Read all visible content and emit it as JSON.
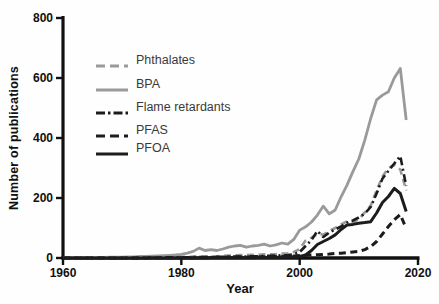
{
  "figure": {
    "background": "#fefefe",
    "axis_color": "#111111",
    "gray_series_color": "#9a9a9a",
    "black_series_color": "#1c1c1c"
  },
  "chart_data": {
    "type": "line",
    "title": "",
    "xlabel": "Year",
    "ylabel": "Number of publications",
    "xlim": [
      1960,
      2020
    ],
    "ylim": [
      0,
      800
    ],
    "xticks": [
      1960,
      1980,
      2000,
      2020
    ],
    "yticks": [
      0,
      200,
      400,
      600,
      800
    ],
    "grid": false,
    "legend_position": "upper-left-inside",
    "x": [
      1960,
      1961,
      1962,
      1963,
      1964,
      1965,
      1966,
      1967,
      1968,
      1969,
      1970,
      1971,
      1972,
      1973,
      1974,
      1975,
      1976,
      1977,
      1978,
      1979,
      1980,
      1981,
      1982,
      1983,
      1984,
      1985,
      1986,
      1987,
      1988,
      1989,
      1990,
      1991,
      1992,
      1993,
      1994,
      1995,
      1996,
      1997,
      1998,
      1999,
      2000,
      2001,
      2002,
      2003,
      2004,
      2005,
      2006,
      2007,
      2008,
      2009,
      2010,
      2011,
      2012,
      2013,
      2014,
      2015,
      2016,
      2017,
      2018
    ],
    "series": [
      {
        "name": "Phthalates",
        "color": "#9a9a9a",
        "line_style": "dashed",
        "line_width": 2.6,
        "values": [
          0,
          0,
          0,
          0,
          0,
          0,
          0,
          0,
          1,
          1,
          1,
          1,
          2,
          2,
          2,
          2,
          3,
          3,
          3,
          3,
          4,
          4,
          5,
          5,
          5,
          6,
          6,
          7,
          8,
          9,
          10,
          10,
          11,
          11,
          12,
          12,
          13,
          15,
          16,
          20,
          30,
          58,
          68,
          80,
          78,
          90,
          100,
          112,
          122,
          118,
          130,
          152,
          175,
          225,
          272,
          300,
          310,
          295,
          225
        ]
      },
      {
        "name": "BPA",
        "color": "#9a9a9a",
        "line_style": "solid",
        "line_width": 2.8,
        "values": [
          1,
          1,
          1,
          2,
          1,
          2,
          2,
          2,
          3,
          3,
          3,
          4,
          4,
          5,
          5,
          6,
          7,
          8,
          9,
          10,
          12,
          16,
          22,
          33,
          25,
          28,
          25,
          30,
          36,
          40,
          42,
          36,
          40,
          42,
          46,
          40,
          44,
          50,
          46,
          62,
          93,
          104,
          120,
          143,
          173,
          147,
          160,
          204,
          243,
          288,
          330,
          393,
          465,
          527,
          543,
          554,
          600,
          632,
          460
        ]
      },
      {
        "name": "Flame retardants",
        "color": "#1c1c1c",
        "line_style": "dash-dot",
        "line_width": 2.6,
        "values": [
          0,
          0,
          0,
          0,
          0,
          0,
          0,
          0,
          0,
          0,
          0,
          0,
          0,
          1,
          1,
          1,
          1,
          1,
          2,
          2,
          2,
          2,
          3,
          3,
          3,
          3,
          4,
          4,
          4,
          5,
          5,
          5,
          6,
          6,
          7,
          7,
          8,
          9,
          10,
          12,
          20,
          40,
          60,
          90,
          70,
          85,
          95,
          105,
          118,
          125,
          135,
          148,
          170,
          215,
          265,
          290,
          315,
          340,
          240
        ]
      },
      {
        "name": "PFAS",
        "color": "#1c1c1c",
        "line_style": "dashed",
        "line_width": 3,
        "values": [
          0,
          0,
          0,
          0,
          0,
          0,
          0,
          0,
          0,
          0,
          0,
          0,
          0,
          0,
          0,
          1,
          1,
          1,
          1,
          1,
          1,
          1,
          1,
          2,
          2,
          2,
          2,
          2,
          3,
          3,
          3,
          3,
          4,
          4,
          4,
          5,
          5,
          6,
          6,
          7,
          8,
          9,
          10,
          11,
          12,
          13,
          15,
          16,
          18,
          20,
          22,
          28,
          38,
          55,
          80,
          105,
          128,
          145,
          98
        ]
      },
      {
        "name": "PFOA",
        "color": "#1c1c1c",
        "line_style": "solid",
        "line_width": 3,
        "values": [
          0,
          0,
          0,
          0,
          0,
          0,
          0,
          0,
          0,
          0,
          0,
          0,
          0,
          0,
          0,
          0,
          0,
          0,
          0,
          0,
          0,
          0,
          0,
          0,
          0,
          1,
          1,
          1,
          1,
          1,
          1,
          1,
          1,
          2,
          2,
          2,
          2,
          3,
          3,
          4,
          5,
          10,
          25,
          45,
          55,
          65,
          77,
          95,
          110,
          112,
          116,
          118,
          121,
          150,
          185,
          205,
          232,
          215,
          155
        ]
      }
    ]
  }
}
